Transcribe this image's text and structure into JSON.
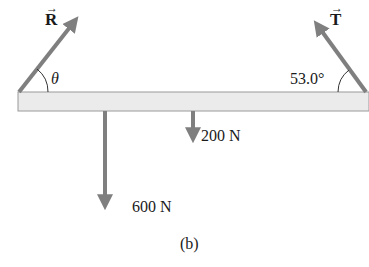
{
  "diagram": {
    "beam": {
      "color_fill": "#ebebeb",
      "color_stroke": "#9a9a9a"
    },
    "arrow_color": "#7f7f7f",
    "forces": {
      "R": {
        "label": "R",
        "vector_mark": "→",
        "angle_label": "θ"
      },
      "T": {
        "label": "T",
        "vector_mark": "→",
        "angle_label": "53.0°"
      },
      "weight_large": {
        "label": "600 N"
      },
      "weight_small": {
        "label": "200 N"
      }
    },
    "caption": "(b)"
  }
}
